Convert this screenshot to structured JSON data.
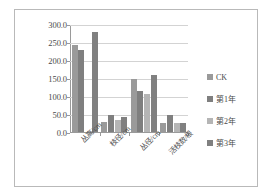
{
  "chart_data": {
    "type": "bar",
    "title": "",
    "xlabel": "",
    "ylabel": "",
    "ylim": [
      0,
      300
    ],
    "ytick_step": 50,
    "grid": true,
    "legend_position": "right",
    "categories": [
      "丛高/cm",
      "枝径/cm",
      "丛径/cm",
      "活枝数/根"
    ],
    "ytick_labels": [
      "0.0",
      "50.0",
      "100.0",
      "150.0",
      "200.0",
      "250.0",
      "300.0"
    ],
    "ytick_values": [
      0,
      50,
      100,
      150,
      200,
      250,
      300
    ],
    "series": [
      {
        "name": "CK",
        "color": "#9a9a9a",
        "values": [
          242.0,
          28.0,
          147.0,
          26.0
        ]
      },
      {
        "name": "第1年",
        "color": "#7f7f7f",
        "values": [
          227.0,
          47.0,
          113.0,
          48.0
        ]
      },
      {
        "name": "第2年",
        "color": "#b5b5b5",
        "values": [
          0.0,
          33.0,
          105.0,
          25.0
        ]
      },
      {
        "name": "第3年",
        "color": "#808080",
        "values": [
          277.0,
          41.0,
          159.0,
          25.0
        ]
      }
    ]
  },
  "colors": {
    "frame_border": "#b9b9b9",
    "grid": "#d3d3d3",
    "axis": "#9a9a9a",
    "text": "#4a4a4a",
    "background": "#ffffff"
  }
}
